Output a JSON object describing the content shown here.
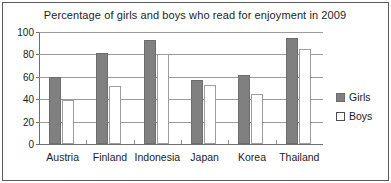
{
  "chart_data": {
    "type": "bar",
    "title": "Percentage of girls and boys who read for enjoyment in 2009",
    "xlabel": "",
    "ylabel": "",
    "ylim": [
      0,
      100
    ],
    "yticks": [
      0,
      20,
      40,
      60,
      80,
      100
    ],
    "grid": true,
    "legend_position": "right",
    "categories": [
      "Austria",
      "Finland",
      "Indonesia",
      "Japan",
      "Korea",
      "Thailand"
    ],
    "series": [
      {
        "name": "Girls",
        "color": "#808080",
        "values": [
          60,
          81,
          93,
          57,
          62,
          95
        ]
      },
      {
        "name": "Boys",
        "color": "#ffffff",
        "values": [
          39,
          52,
          80,
          53,
          45,
          85
        ]
      }
    ]
  },
  "legend": {
    "items": [
      {
        "label": "Girls",
        "swatch": "filled-gray-square-icon"
      },
      {
        "label": "Boys",
        "swatch": "outlined-white-square-icon"
      }
    ]
  }
}
